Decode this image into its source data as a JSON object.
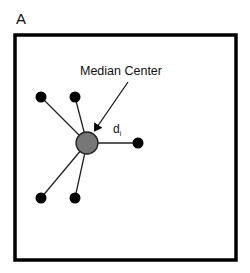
{
  "panel": {
    "label": "A"
  },
  "labels": {
    "median_center": "Median Center",
    "distance_symbol": "d",
    "distance_subscript": "i"
  },
  "colors": {
    "frame": "#000000",
    "points": "#000000",
    "center_fill": "#777777",
    "edges": "#222222"
  },
  "diagram": {
    "frame": {
      "x": 15,
      "y": 35,
      "width": 221,
      "height": 225
    },
    "center": {
      "x": 87,
      "y": 143,
      "r": 11
    },
    "points": [
      {
        "id": "p1",
        "x": 41,
        "y": 97
      },
      {
        "id": "p2",
        "x": 75,
        "y": 97
      },
      {
        "id": "p3",
        "x": 138,
        "y": 143
      },
      {
        "id": "p4",
        "x": 41,
        "y": 198
      },
      {
        "id": "p5",
        "x": 75,
        "y": 198
      }
    ],
    "arrow": {
      "from": [
        128,
        82
      ],
      "to": [
        95,
        132
      ]
    }
  }
}
